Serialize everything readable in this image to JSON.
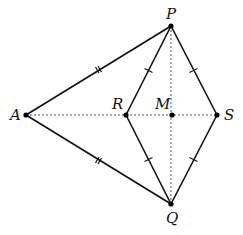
{
  "diagram": {
    "type": "geometry",
    "colors": {
      "line": "#111111",
      "dashed": "#555555",
      "point": "#000000",
      "background": "#ffffff"
    },
    "points": {
      "P": {
        "label": "P",
        "x": 171,
        "y": 26
      },
      "A": {
        "label": "A",
        "x": 26,
        "y": 115
      },
      "R": {
        "label": "R",
        "x": 126,
        "y": 115
      },
      "M": {
        "label": "M",
        "x": 172,
        "y": 115
      },
      "S": {
        "label": "S",
        "x": 217,
        "y": 115
      },
      "Q": {
        "label": "Q",
        "x": 171,
        "y": 204
      }
    },
    "solid_segments": [
      {
        "from": "A",
        "to": "P",
        "ticks": 2
      },
      {
        "from": "A",
        "to": "Q",
        "ticks": 2
      },
      {
        "from": "P",
        "to": "R",
        "ticks": 1
      },
      {
        "from": "R",
        "to": "Q",
        "ticks": 1
      },
      {
        "from": "P",
        "to": "S",
        "ticks": 1
      },
      {
        "from": "S",
        "to": "Q",
        "ticks": 1
      }
    ],
    "dashed_segments": [
      {
        "from": "A",
        "to": "S"
      },
      {
        "from": "P",
        "to": "Q"
      }
    ],
    "labels": {
      "P": "P",
      "A": "A",
      "R": "R",
      "M": "M",
      "S": "S",
      "Q": "Q"
    }
  }
}
